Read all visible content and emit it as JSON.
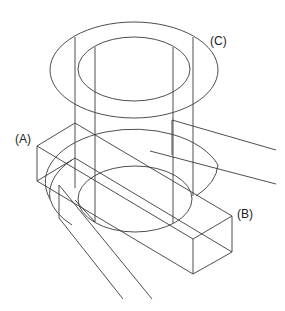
{
  "figure": {
    "type": "isometric line drawing",
    "labels": {
      "a": "(A)",
      "b": "(B)",
      "c": "(C)"
    },
    "caption_clipped": true,
    "line_color": "#3a3a3a",
    "background": "#ffffff"
  }
}
